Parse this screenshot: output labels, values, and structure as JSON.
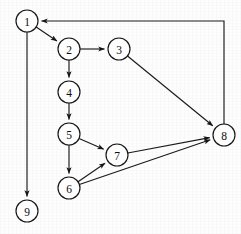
{
  "graph": {
    "title": "directed-graph",
    "type": "directed-graph",
    "canvas": {
      "width": 241,
      "height": 234
    },
    "style": {
      "background_color": "#fdfdfd",
      "node_fill": "#fdfdfd",
      "node_stroke": "#151515",
      "edge_color": "#1a1a1a",
      "label_color": "#0d0d0d",
      "node_radius": 11
    },
    "nodes": [
      {
        "id": "1",
        "label": "1",
        "x": 27,
        "y": 21
      },
      {
        "id": "2",
        "label": "2",
        "x": 69,
        "y": 49
      },
      {
        "id": "3",
        "label": "3",
        "x": 119,
        "y": 49
      },
      {
        "id": "4",
        "label": "4",
        "x": 69,
        "y": 92
      },
      {
        "id": "5",
        "label": "5",
        "x": 69,
        "y": 134
      },
      {
        "id": "6",
        "label": "6",
        "x": 69,
        "y": 188
      },
      {
        "id": "7",
        "label": "7",
        "x": 117,
        "y": 155
      },
      {
        "id": "8",
        "label": "8",
        "x": 224,
        "y": 135
      },
      {
        "id": "9",
        "label": "9",
        "x": 27,
        "y": 211
      }
    ],
    "edges": [
      {
        "from": "1",
        "to": "2",
        "kind": "straight"
      },
      {
        "from": "1",
        "to": "9",
        "kind": "straight"
      },
      {
        "from": "2",
        "to": "3",
        "kind": "straight"
      },
      {
        "from": "2",
        "to": "4",
        "kind": "straight"
      },
      {
        "from": "3",
        "to": "8",
        "kind": "straight"
      },
      {
        "from": "4",
        "to": "5",
        "kind": "straight"
      },
      {
        "from": "5",
        "to": "6",
        "kind": "straight"
      },
      {
        "from": "5",
        "to": "7",
        "kind": "straight"
      },
      {
        "from": "6",
        "to": "7",
        "kind": "straight"
      },
      {
        "from": "6",
        "to": "8",
        "kind": "straight"
      },
      {
        "from": "7",
        "to": "8",
        "kind": "straight"
      },
      {
        "from": "8",
        "to": "1",
        "kind": "orthogonal",
        "waypoints": [
          [
            224,
            21
          ]
        ]
      }
    ]
  }
}
